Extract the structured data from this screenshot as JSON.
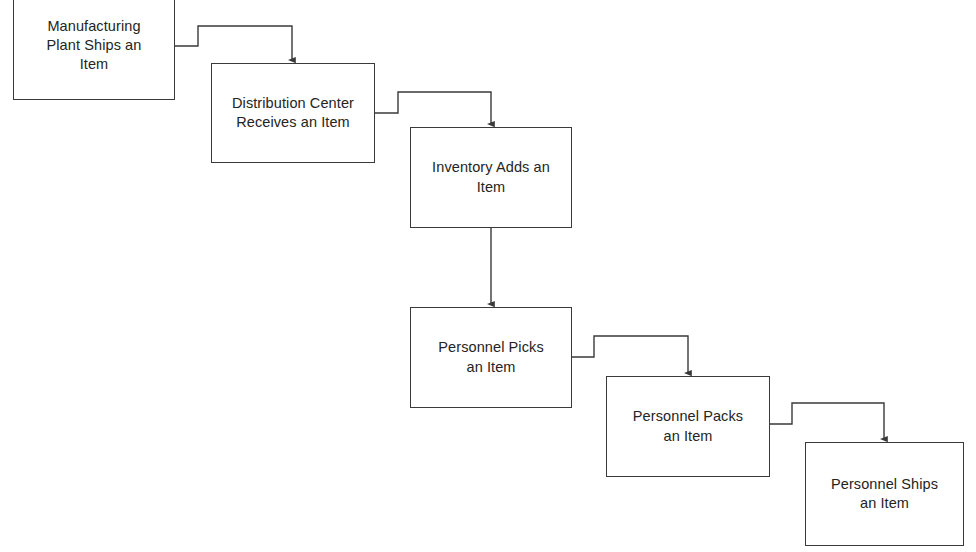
{
  "diagram": {
    "type": "flowchart",
    "orientation": "cascading-staircase",
    "background_color": "#ffffff",
    "line_color": "#3a3a3a",
    "text_color": "#242424",
    "nodes": [
      {
        "id": "node-manufacturing-plant-ships",
        "label": "Manufacturing\nPlant Ships an\nItem",
        "shape": "rectangle",
        "x": 13,
        "y": -9,
        "width": 162,
        "height": 109
      },
      {
        "id": "node-distribution-center-receives",
        "label": "Distribution Center\nReceives an Item",
        "shape": "rectangle",
        "x": 211,
        "y": 63,
        "width": 164,
        "height": 100
      },
      {
        "id": "node-inventory-adds",
        "label": "Inventory Adds an\nItem",
        "shape": "rectangle",
        "x": 410,
        "y": 127,
        "width": 162,
        "height": 101
      },
      {
        "id": "node-personnel-picks",
        "label": "Personnel Picks\nan Item",
        "shape": "rectangle",
        "x": 410,
        "y": 307,
        "width": 162,
        "height": 101
      },
      {
        "id": "node-personnel-packs",
        "label": "Personnel Packs\nan Item",
        "shape": "rectangle",
        "x": 606,
        "y": 376,
        "width": 164,
        "height": 101
      },
      {
        "id": "node-personnel-ships",
        "label": "Personnel Ships\nan Item",
        "shape": "rectangle",
        "x": 805,
        "y": 442,
        "width": 159,
        "height": 104
      }
    ],
    "connectors": [
      {
        "id": "connector-plant-to-distribution",
        "from": "node-manufacturing-plant-ships",
        "to": "node-distribution-center-receives",
        "style": "elbow",
        "arrowhead": "down",
        "points": "175,46 198,46 198,26 292,26 292,60"
      },
      {
        "id": "connector-distribution-to-inventory",
        "from": "node-distribution-center-receives",
        "to": "node-inventory-adds",
        "style": "elbow",
        "arrowhead": "down",
        "points": "375,113 398,113 398,92 491,92 491,124"
      },
      {
        "id": "connector-inventory-to-picks",
        "from": "node-inventory-adds",
        "to": "node-personnel-picks",
        "style": "straight",
        "arrowhead": "down",
        "points": "491,228 491,304"
      },
      {
        "id": "connector-picks-to-packs",
        "from": "node-personnel-picks",
        "to": "node-personnel-packs",
        "style": "elbow",
        "arrowhead": "down",
        "points": "572,357 594,357 594,336 688,336 688,373"
      },
      {
        "id": "connector-packs-to-ships",
        "from": "node-personnel-packs",
        "to": "node-personnel-ships",
        "style": "elbow",
        "arrowhead": "down",
        "points": "770,424 792,424 792,403 884,403 884,439"
      }
    ]
  }
}
